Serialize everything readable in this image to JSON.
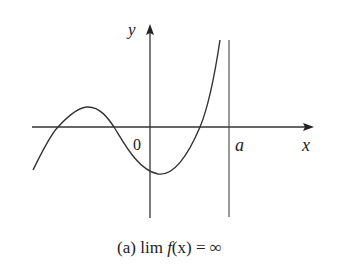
{
  "figure": {
    "axis_labels": {
      "x": "x",
      "y": "y",
      "origin": "0",
      "asymptote": "a"
    },
    "caption": {
      "prefix": "(a) lim ",
      "func": "f",
      "arg": "(x)",
      "rest": " = ∞"
    },
    "colors": {
      "ink": "#333333",
      "background": "#ffffff"
    }
  }
}
